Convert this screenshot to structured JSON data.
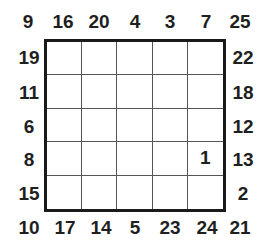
{
  "puzzle": {
    "type": "skyscraper-style number grid",
    "size": 5,
    "clues": {
      "top": [
        "16",
        "20",
        "4",
        "3",
        "7"
      ],
      "bottom": [
        "17",
        "14",
        "5",
        "23",
        "24"
      ],
      "left": [
        "19",
        "11",
        "6",
        "8",
        "15"
      ],
      "right": [
        "22",
        "18",
        "12",
        "13",
        "2"
      ],
      "corners": {
        "top_left": "9",
        "top_right": "25",
        "bottom_left": "10",
        "bottom_right": "21"
      }
    },
    "cells": [
      [
        "",
        "",
        "",
        "",
        ""
      ],
      [
        "",
        "",
        "",
        "",
        ""
      ],
      [
        "",
        "",
        "",
        "",
        ""
      ],
      [
        "",
        "",
        "",
        "",
        "1"
      ],
      [
        "",
        "",
        "",
        "",
        ""
      ]
    ]
  }
}
